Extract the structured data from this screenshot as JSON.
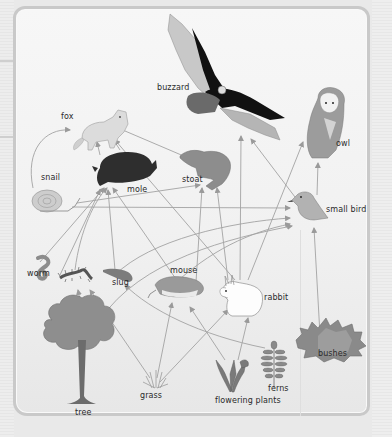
{
  "diagram": {
    "type": "food web",
    "colors": {
      "background": "#e9e9e9",
      "panel": "#f3f3f3",
      "panel_border": "#c9c9c9",
      "arrow": "#9a9a9a",
      "label_text": "#2a2a2a"
    },
    "organisms": [
      {
        "id": "buzzard",
        "label": "buzzard"
      },
      {
        "id": "fox",
        "label": "fox"
      },
      {
        "id": "owl",
        "label": "owl"
      },
      {
        "id": "snail",
        "label": "snail"
      },
      {
        "id": "mole",
        "label": "mole"
      },
      {
        "id": "stoat",
        "label": "stoat"
      },
      {
        "id": "small_bird",
        "label": "small bird"
      },
      {
        "id": "worm",
        "label": "worm"
      },
      {
        "id": "slug",
        "label": "slug"
      },
      {
        "id": "mouse",
        "label": "mouse"
      },
      {
        "id": "rabbit",
        "label": "rabbit"
      },
      {
        "id": "bushes",
        "label": "bushes"
      },
      {
        "id": "tree",
        "label": "tree"
      },
      {
        "id": "grass",
        "label": "grass"
      },
      {
        "id": "flowering_plants",
        "label": "flowering plants"
      },
      {
        "id": "ferns",
        "label": "ferns"
      },
      {
        "id": "centipede",
        "label": ""
      }
    ],
    "arrows": [
      {
        "from": "snail",
        "to": "fox"
      },
      {
        "from": "mole",
        "to": "fox"
      },
      {
        "from": "stoat",
        "to": "fox"
      },
      {
        "from": "rabbit",
        "to": "fox"
      },
      {
        "from": "snail",
        "to": "stoat"
      },
      {
        "from": "snail",
        "to": "small_bird"
      },
      {
        "from": "worm",
        "to": "mole"
      },
      {
        "from": "centipede",
        "to": "mole"
      },
      {
        "from": "slug",
        "to": "mole"
      },
      {
        "from": "mouse",
        "to": "mole"
      },
      {
        "from": "mouse",
        "to": "stoat"
      },
      {
        "from": "rabbit",
        "to": "stoat"
      },
      {
        "from": "rabbit",
        "to": "buzzard"
      },
      {
        "from": "small_bird",
        "to": "buzzard"
      },
      {
        "from": "rabbit",
        "to": "owl"
      },
      {
        "from": "small_bird",
        "to": "owl"
      },
      {
        "from": "slug",
        "to": "small_bird"
      },
      {
        "from": "mouse",
        "to": "small_bird"
      },
      {
        "from": "bushes",
        "to": "small_bird"
      },
      {
        "from": "tree",
        "to": "centipede"
      },
      {
        "from": "tree",
        "to": "small_bird"
      },
      {
        "from": "grass",
        "to": "centipede"
      },
      {
        "from": "grass",
        "to": "mouse"
      },
      {
        "from": "grass",
        "to": "rabbit"
      },
      {
        "from": "flowering_plants",
        "to": "slug"
      },
      {
        "from": "flowering_plants",
        "to": "mouse"
      },
      {
        "from": "flowering_plants",
        "to": "rabbit"
      },
      {
        "from": "ferns",
        "to": "slug"
      }
    ]
  }
}
